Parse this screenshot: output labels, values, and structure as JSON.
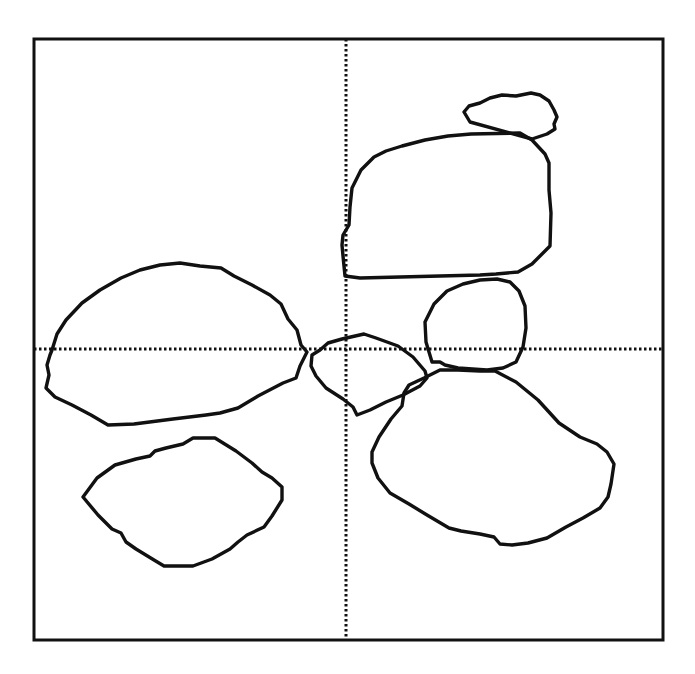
{
  "diagram": {
    "stroke_color": "#111111",
    "background": "#ffffff",
    "frame": {
      "x": 34,
      "y": 39,
      "width": 629,
      "height": 601
    },
    "crosshair": {
      "vertical_x": 346,
      "horizontal_y": 349,
      "style": "dotted"
    },
    "shapes": [
      {
        "id": "small-top-right-blob",
        "points": "470,122 464,112 469,106 480,103 490,98 502,95 516,96 531,93 540,95 549,101 554,110 557,117 554,124 555,129 547,134 532,139"
      },
      {
        "id": "large-upper-right-blob",
        "points": "345,276 343,256 342,245 343,235 349,225 350,207 352,188 361,170 374,157 386,151 402,146 425,140 448,136 471,134 520,133 532,140 545,154 549,163 549,190 551,213 550,246 532,264 518,272 496,274 480,275 440,276 400,277 360,278"
      },
      {
        "id": "round-middle-right-blob",
        "points": "432,362 426,342 425,322 434,304 447,291 463,284 480,280 497,279 510,282 519,291 525,306 526,328 523,347 516,362 503,368 487,370 458,368 445,365 440,362"
      },
      {
        "id": "small-center-blob",
        "points": "320,350 328,343 342,339 364,334 376,338 398,346 413,357 425,371 427,378 420,386 403,395 386,402 370,410 357,415 353,407 343,399 326,388 316,376 311,366 312,355"
      },
      {
        "id": "large-lower-right-blob",
        "points": "424,378 440,370 458,370 480,371 495,371 516,382 538,400 559,423 580,437 597,444 607,452 614,464 611,484 608,497 600,508 583,518 566,527 547,538 528,543 512,545 500,544 494,537 480,534 461,531 449,528 427,515 409,504 390,493 378,478 372,463 372,452 379,437 391,419 402,406 404,393 409,385"
      },
      {
        "id": "large-left-blob",
        "points": "52,350 57,334 66,320 82,303 100,290 121,278 140,270 160,265 180,263 200,266 221,268 234,276 252,285 270,295 281,304 288,319 297,330 301,345 307,352 300,366 296,378 283,383 258,396 238,408 220,413 206,415 173,419 134,424 108,425 91,415 72,405 55,397 46,388 49,375 47,365 50,355"
      },
      {
        "id": "lower-left-blob",
        "points": "83,497 97,478 115,465 136,459 150,456 155,451 166,448 183,444 193,438 215,438 236,451 252,463 262,472 272,478 282,487 282,500 272,516 264,527 247,535 238,542 230,549 212,559 193,566 164,566 154,560 136,549 126,542 121,533 112,529 98,515"
      }
    ]
  }
}
